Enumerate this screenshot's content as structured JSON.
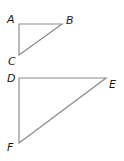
{
  "diagram": {
    "stroke_color": "#8c8c8c",
    "label_color": "#1a1a1a",
    "triangles": [
      {
        "name": "ABC",
        "vertices": {
          "A": {
            "label": "A",
            "x": 19,
            "y": 24
          },
          "B": {
            "label": "B",
            "x": 62,
            "y": 24
          },
          "C": {
            "label": "C",
            "x": 19,
            "y": 55
          }
        }
      },
      {
        "name": "DEF",
        "vertices": {
          "D": {
            "label": "D",
            "x": 19,
            "y": 78
          },
          "E": {
            "label": "E",
            "x": 106,
            "y": 78
          },
          "F": {
            "label": "F",
            "x": 19,
            "y": 143
          }
        }
      }
    ]
  }
}
